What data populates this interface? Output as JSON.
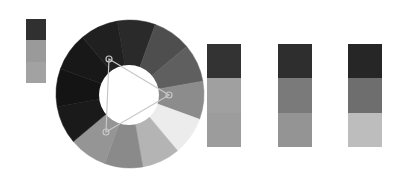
{
  "wheel": {
    "center": [
      130,
      94
    ],
    "outer_radius": 74,
    "inner_radius": 30,
    "segments": [
      {
        "start": -100,
        "end": -70,
        "color": "#2a2a2a"
      },
      {
        "start": -70,
        "end": -40,
        "color": "#4e4e4e"
      },
      {
        "start": -40,
        "end": -10,
        "color": "#5f5f5f"
      },
      {
        "start": -10,
        "end": 20,
        "color": "#8c8c8c"
      },
      {
        "start": 20,
        "end": 50,
        "color": "#ececec"
      },
      {
        "start": 50,
        "end": 80,
        "color": "#b4b4b4"
      },
      {
        "start": 80,
        "end": 110,
        "color": "#8a8a8a"
      },
      {
        "start": 110,
        "end": 140,
        "color": "#959595"
      },
      {
        "start": 140,
        "end": 170,
        "color": "#1a1a1a"
      },
      {
        "start": 170,
        "end": 200,
        "color": "#141414"
      },
      {
        "start": 200,
        "end": 230,
        "color": "#181818"
      },
      {
        "start": 230,
        "end": 260,
        "color": "#202020"
      }
    ],
    "handles": [
      {
        "name": "handle-primary",
        "x": 109,
        "y": 59
      },
      {
        "name": "handle-secondary",
        "x": 169,
        "y": 95
      },
      {
        "name": "handle-tertiary",
        "x": 106,
        "y": 132
      }
    ],
    "connector_color": "#c8c8c8"
  },
  "base_swatch": {
    "x": 26,
    "y": 19,
    "w": 20,
    "h": 64,
    "colors": [
      "#303030",
      "#9a9a9a",
      "#a2a2a2"
    ]
  },
  "palettes": [
    {
      "x": 207,
      "y": 44,
      "w": 34,
      "h": 103,
      "colors": [
        "#333333",
        "#a0a0a0",
        "#9c9c9c"
      ]
    },
    {
      "x": 278,
      "y": 44,
      "w": 34,
      "h": 103,
      "colors": [
        "#2e2e2e",
        "#7a7a7a",
        "#949494"
      ]
    },
    {
      "x": 348,
      "y": 44,
      "w": 34,
      "h": 103,
      "colors": [
        "#262626",
        "#6e6e6e",
        "#bdbdbd"
      ]
    }
  ]
}
